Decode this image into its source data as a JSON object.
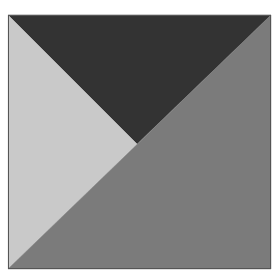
{
  "diagram": {
    "type": "square-partitioned-into-triangles",
    "background": "#ffffff",
    "square": {
      "x": 8,
      "y": 15,
      "width": 263,
      "height": 254,
      "stroke": "#555555"
    },
    "center_vertex": {
      "x": 137,
      "y": 144
    },
    "regions": [
      {
        "name": "top-triangle",
        "shade": "dark",
        "color": "#333333",
        "points": "8,15 271,15 137,144"
      },
      {
        "name": "left-triangle",
        "shade": "light",
        "color": "#c9c9c9",
        "points": "8,15 137,144 8,269"
      },
      {
        "name": "bottom-right-triangle",
        "shade": "medium",
        "color": "#7b7b7b",
        "points": "271,15 271,269 8,269"
      }
    ]
  }
}
